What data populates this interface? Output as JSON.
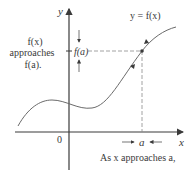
{
  "diagram": {
    "axis": {
      "x_label": "x",
      "y_label": "y",
      "origin_label": "0"
    },
    "curve_label": "y = f(x)",
    "point": {
      "x_label": "a",
      "y_label": "f(a)"
    },
    "left_note": [
      "f(x)",
      "approaches",
      "f(a)."
    ],
    "bottom_note": "As x approaches a,",
    "colors": {
      "ink": "#3a3a3a",
      "curve": "#6a6a6a",
      "dashed": "#8a8a8a"
    }
  }
}
